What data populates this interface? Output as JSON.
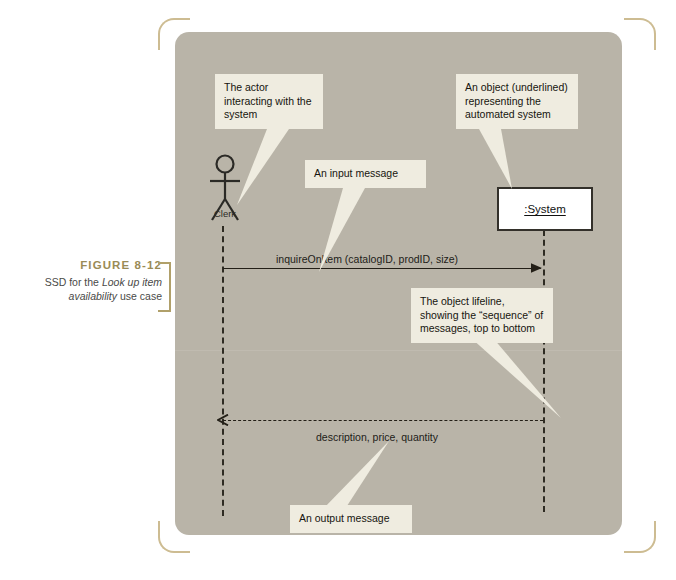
{
  "figure": {
    "number": "FIGURE 8-12",
    "caption_prefix": "SSD for the ",
    "caption_italic": "Look up item availability",
    "caption_suffix": " use case"
  },
  "diagram": {
    "type": "uml-system-sequence-diagram",
    "actor": {
      "name": "Clerk",
      "icon": "stick-figure-actor-icon"
    },
    "object": {
      "name": ":System",
      "underlined": true
    },
    "messages": [
      {
        "id": "request",
        "label": "inquireOnItem (catalogID, prodID, size)",
        "direction": "actor-to-system",
        "line_style": "solid",
        "arrow": "filled"
      },
      {
        "id": "response",
        "label": "description, price, quantity",
        "direction": "system-to-actor",
        "line_style": "dashed",
        "arrow": "open"
      }
    ],
    "callouts": [
      {
        "id": "actor",
        "text": "The actor interacting with the system",
        "tail": "down-left"
      },
      {
        "id": "object",
        "text": "An object (underlined) representing the automated system",
        "tail": "down"
      },
      {
        "id": "input",
        "text": "An input message",
        "tail": "down-left"
      },
      {
        "id": "lifeline",
        "text": "The object lifeline, showing the “sequence” of messages, top to bottom",
        "tail": "down-right"
      },
      {
        "id": "output",
        "text": "An output message",
        "tail": "up-right"
      }
    ]
  },
  "colors": {
    "panel_background": "#b9b4a8",
    "callout_background": "#efece0",
    "line": "#231f17",
    "caption_accent": "#9a8b56",
    "bracket": "#cdbc92",
    "object_box_fill": "#ffffff"
  }
}
